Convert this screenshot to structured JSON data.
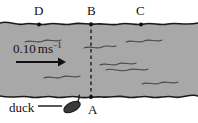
{
  "figure": {
    "type": "physics-diagram",
    "colors": {
      "water_fill": "#a8a8a8",
      "bank_line": "#1a1a1a",
      "ripple": "#4a4a4a",
      "dashed_line": "#1a1a1a",
      "duck_body": "#3a3a3a",
      "text": "#111111",
      "background": "#ffffff"
    },
    "labels": {
      "point_D": "D",
      "point_B": "B",
      "point_C": "C",
      "point_A": "A",
      "duck": "duck",
      "velocity_value": "0.10",
      "velocity_unit_m": "m",
      "velocity_unit_s": "s",
      "velocity_unit_exp": "−1",
      "velocity_full": "0.10 m s−1"
    },
    "geometry": {
      "river_top_y": 23,
      "river_bottom_y": 96,
      "point_D_x": 39,
      "point_B_x": 91,
      "point_C_x": 141,
      "point_A_x": 91,
      "dashed_line_from": "B",
      "dashed_line_to": "A",
      "flow_direction": "left-to-right",
      "arrow_start_x": 16,
      "arrow_end_x": 64,
      "arrow_y": 62,
      "duck_x": 72,
      "duck_y": 107
    }
  }
}
